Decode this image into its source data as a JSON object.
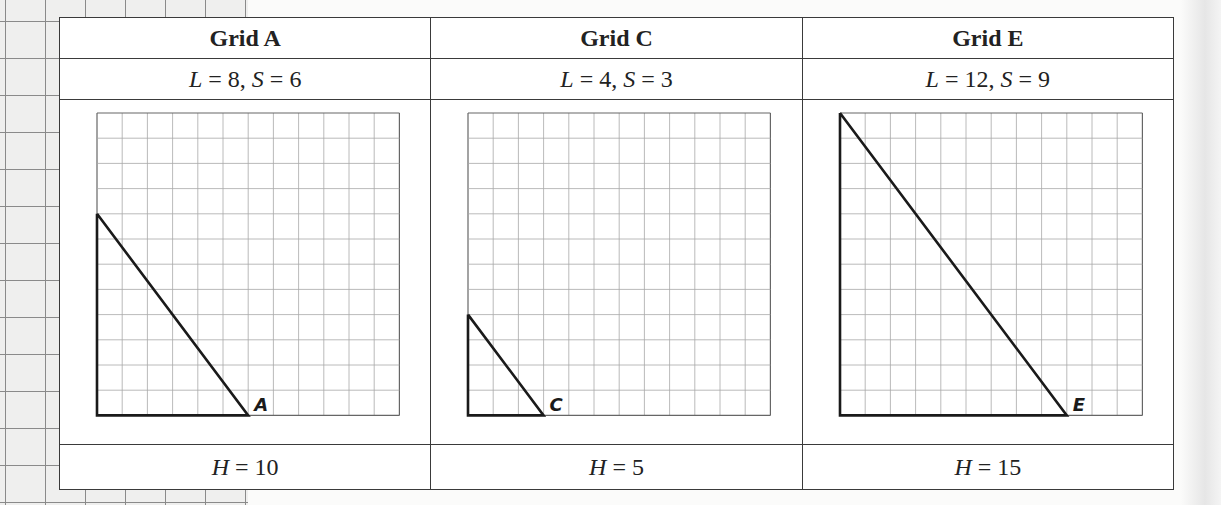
{
  "panels": [
    {
      "title": "Grid A",
      "L_label": "L",
      "L_value": "8",
      "S_label": "S",
      "S_value": "6",
      "H_label": "H",
      "H_value": "10",
      "vertex_label": "A"
    },
    {
      "title": "Grid C",
      "L_label": "L",
      "L_value": "4",
      "S_label": "S",
      "S_value": "3",
      "H_label": "H",
      "H_value": "5",
      "vertex_label": "C"
    },
    {
      "title": "Grid E",
      "L_label": "L",
      "L_value": "12",
      "S_label": "S",
      "S_value": "9",
      "H_label": "H",
      "H_value": "15",
      "vertex_label": "E"
    }
  ],
  "grid": {
    "cols": 12,
    "rows": 12
  },
  "triangles": [
    {
      "vertical_leg": 8,
      "horizontal_leg": 6
    },
    {
      "vertical_leg": 4,
      "horizontal_leg": 3
    },
    {
      "vertical_leg": 12,
      "horizontal_leg": 9
    }
  ],
  "symbols": {
    "equals": " = ",
    "comma": ", "
  }
}
